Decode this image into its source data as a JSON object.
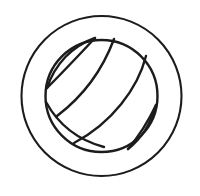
{
  "canvas": {
    "width": 200,
    "height": 196,
    "background_color": "#ffffff"
  },
  "artwork": {
    "title": "Volleyball",
    "style": "line-art-outline",
    "stroke_color": "#1c1c1c",
    "fill_color": "none",
    "outer_ring": {
      "name": "outer-circle",
      "center_x": 101.5,
      "center_y": 96,
      "radius": 80,
      "stroke_width": 2.1
    },
    "ball_circle": {
      "name": "ball-outline-circle",
      "center_x": 101.5,
      "center_y": 96,
      "radius": 56,
      "stroke_width": 2.4
    },
    "seams": [
      {
        "name": "upper-left-lens-outer",
        "path": "M95,38 C72,46 55,64 47,88",
        "stroke_width": 2.4
      },
      {
        "name": "upper-left-lens-inner",
        "path": "M95,38 C80,54 63,72 47,88",
        "stroke_width": 2.4
      },
      {
        "name": "stripe-upper",
        "path": "M114,39 C104,66 86,94 57,116",
        "stroke_width": 2.4
      },
      {
        "name": "stripe-middle",
        "path": "M146,56 C138,88 112,123 74,143",
        "stroke_width": 2.4
      },
      {
        "name": "stripe-lower",
        "path": "M156,105 C151,123 141,139 128,149",
        "stroke_width": 2.4
      },
      {
        "name": "lower-right-lens-chord",
        "path": "M128,149 C139,136 148,122 156,105",
        "stroke_width": 2.4
      },
      {
        "name": "lower-left-seam",
        "path": "M46,102 C58,124 78,140 104,147",
        "stroke_width": 2.4
      }
    ]
  }
}
